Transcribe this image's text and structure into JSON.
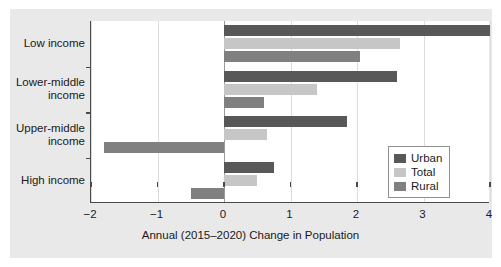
{
  "chart_data": {
    "type": "bar",
    "orientation": "horizontal",
    "title": "",
    "xlabel": "Annual (2015–2020) Change in Population",
    "ylabel": "",
    "xlim": [
      -2,
      4
    ],
    "xticks": [
      "−2",
      "−1",
      "0",
      "1",
      "2",
      "3",
      "4"
    ],
    "xtick_values": [
      -2,
      -1,
      0,
      1,
      2,
      3,
      4
    ],
    "grid": true,
    "legend_position": "center-right",
    "categories": [
      "Low income",
      "Lower-middle\nincome",
      "Upper-middle\nincome",
      "High income"
    ],
    "series": [
      {
        "name": "Urban",
        "color": "#585858",
        "values": [
          4.0,
          2.6,
          1.85,
          0.75
        ]
      },
      {
        "name": "Total",
        "color": "#c6c6c6",
        "values": [
          2.65,
          1.4,
          0.65,
          0.5
        ]
      },
      {
        "name": "Rural",
        "color": "#808080",
        "values": [
          2.05,
          0.6,
          -1.8,
          -0.5
        ]
      }
    ]
  },
  "legend": {
    "items": [
      {
        "label": "Urban",
        "color": "#585858"
      },
      {
        "label": "Total",
        "color": "#c6c6c6"
      },
      {
        "label": "Rural",
        "color": "#808080"
      }
    ]
  }
}
